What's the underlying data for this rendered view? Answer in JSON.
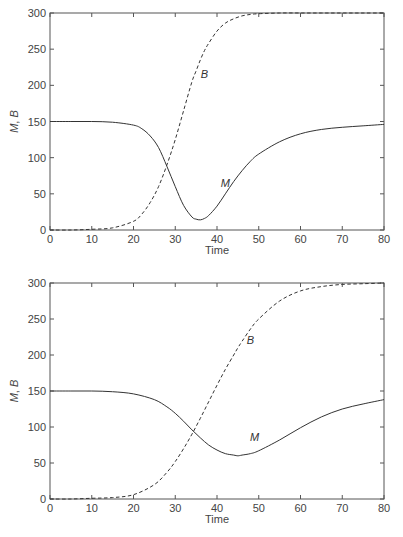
{
  "chart_data": [
    {
      "type": "line",
      "title": "",
      "xlabel": "Time",
      "ylabel": "M, B",
      "xlim": [
        0,
        80
      ],
      "ylim": [
        0,
        300
      ],
      "xticks": [
        0,
        10,
        20,
        30,
        40,
        50,
        60,
        70,
        80
      ],
      "yticks": [
        0,
        50,
        100,
        150,
        200,
        250,
        300
      ],
      "grid": false,
      "legend": "none (inline labels)",
      "annotations": [
        {
          "text": "B",
          "x": 37,
          "y": 210
        },
        {
          "text": "M",
          "x": 42,
          "y": 60
        }
      ],
      "x": [
        0,
        5,
        10,
        15,
        20,
        22,
        24,
        26,
        28,
        30,
        32,
        34,
        35,
        36,
        37,
        38,
        40,
        42,
        44,
        46,
        48,
        50,
        55,
        60,
        65,
        70,
        75,
        80
      ],
      "series": [
        {
          "name": "M",
          "style": "solid",
          "values": [
            150,
            150,
            150,
            149,
            145,
            140,
            130,
            114,
            88,
            60,
            34,
            18,
            15,
            14,
            16,
            20,
            33,
            50,
            67,
            82,
            95,
            105,
            122,
            133,
            139,
            142,
            144,
            146
          ]
        },
        {
          "name": "B",
          "style": "dashed",
          "values": [
            0,
            0,
            1,
            3,
            12,
            22,
            38,
            60,
            90,
            125,
            165,
            205,
            220,
            235,
            248,
            258,
            275,
            286,
            292,
            296,
            298,
            299,
            300,
            300,
            300,
            300,
            300,
            300
          ]
        }
      ]
    },
    {
      "type": "line",
      "title": "",
      "xlabel": "Time",
      "ylabel": "M, B",
      "xlim": [
        0,
        80
      ],
      "ylim": [
        0,
        300
      ],
      "xticks": [
        0,
        10,
        20,
        30,
        40,
        50,
        60,
        70,
        80
      ],
      "yticks": [
        0,
        50,
        100,
        150,
        200,
        250,
        300
      ],
      "grid": false,
      "legend": "none (inline labels)",
      "annotations": [
        {
          "text": "B",
          "x": 48,
          "y": 215
        },
        {
          "text": "M",
          "x": 49,
          "y": 80
        }
      ],
      "x": [
        0,
        5,
        10,
        15,
        20,
        25,
        28,
        30,
        32,
        34,
        36,
        38,
        40,
        42,
        44,
        45,
        46,
        48,
        50,
        55,
        60,
        65,
        70,
        75,
        80
      ],
      "series": [
        {
          "name": "M",
          "style": "solid",
          "values": [
            150,
            150,
            150,
            149,
            146,
            138,
            128,
            119,
            108,
            96,
            85,
            75,
            68,
            63,
            61,
            60,
            61,
            63,
            67,
            82,
            99,
            114,
            125,
            132,
            138
          ]
        },
        {
          "name": "B",
          "style": "dashed",
          "values": [
            0,
            0,
            1,
            2,
            6,
            20,
            37,
            52,
            70,
            90,
            112,
            135,
            158,
            180,
            200,
            210,
            219,
            236,
            250,
            275,
            289,
            295,
            298,
            299,
            300
          ]
        }
      ]
    }
  ]
}
